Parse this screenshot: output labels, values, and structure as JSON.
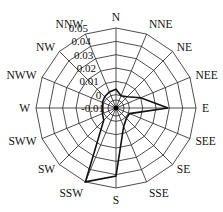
{
  "chart_data": {
    "type": "radar",
    "title": "",
    "directions": [
      "N",
      "NNE",
      "NE",
      "NEE",
      "E",
      "SEE",
      "SE",
      "SSE",
      "S",
      "SSW",
      "SW",
      "SWW",
      "W",
      "NWW",
      "NW",
      "NNW"
    ],
    "series": [
      {
        "name": "frequency",
        "values": [
          0.004,
          0.0,
          0.002,
          0.01,
          0.029,
          0.001,
          0.001,
          0.005,
          0.041,
          0.05,
          0.003,
          0.001,
          0.0,
          0.001,
          0.002,
          0.003
        ]
      }
    ],
    "radial_ticks": [
      -0.01,
      0,
      0.01,
      0.02,
      0.03,
      0.04,
      0.05
    ],
    "radial_tick_labels": [
      "-0.01",
      "0",
      "0.01",
      "0.02",
      "0.03",
      "0.04",
      "0.05"
    ],
    "rlim": [
      -0.01,
      0.05
    ],
    "grid": true,
    "legend": "none",
    "colors": {
      "line": "#111111",
      "grid": "#222222"
    }
  }
}
